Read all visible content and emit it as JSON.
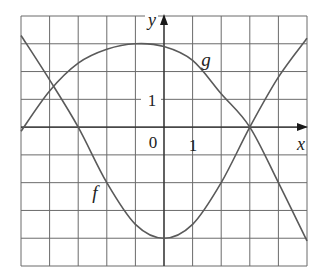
{
  "chart_data": {
    "type": "line",
    "title": "",
    "xlabel": "x",
    "ylabel": "y",
    "xlim": [
      -5,
      5
    ],
    "ylim": [
      -5,
      4
    ],
    "grid": true,
    "tick_labels": {
      "origin": "0",
      "x_one": "1",
      "y_one": "1"
    },
    "series": [
      {
        "name": "f",
        "x": [
          -5,
          -4,
          -3,
          -2,
          -1,
          0,
          1,
          2,
          3,
          4,
          5
        ],
        "values": [
          3.3,
          1.7,
          0,
          -2,
          -3.5,
          -4,
          -3.5,
          -2,
          0,
          1.8,
          3.2
        ]
      },
      {
        "name": "g",
        "x": [
          -5,
          -4,
          -3,
          -2,
          -1,
          0,
          1,
          2,
          3,
          4,
          5
        ],
        "values": [
          -0.15,
          1.3,
          2.3,
          2.8,
          3,
          2.9,
          2.4,
          1.2,
          0,
          -2,
          -4.1
        ]
      }
    ],
    "annotations": [
      {
        "text": "f",
        "x": -2.3,
        "y": -2.4
      },
      {
        "text": "g",
        "x": 1.5,
        "y": 2.4
      }
    ]
  },
  "colors": {
    "grid": "#6b6b6b",
    "axis": "#2a2a2a",
    "curve": "#5a5a5a",
    "background": "#ffffff"
  }
}
